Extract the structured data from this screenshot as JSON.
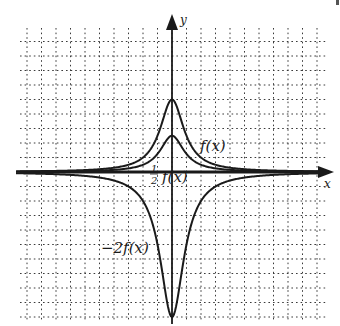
{
  "chart_data": {
    "type": "line",
    "title": "",
    "xlabel": "x",
    "ylabel": "y",
    "grid": true,
    "grid_style": "dotted",
    "xlim": [
      -10.5,
      10.5
    ],
    "ylim": [
      -10.3,
      10.3
    ],
    "axis_ticks_labeled": false,
    "series": [
      {
        "name": "f(x)",
        "label": "f(x)",
        "x": [
          -10,
          -8,
          -6,
          -4,
          -3,
          -2,
          -1.5,
          -1,
          -0.5,
          0,
          0.5,
          1,
          1.5,
          2,
          3,
          4,
          6,
          8,
          10
        ],
        "values": [
          0.05,
          0.08,
          0.14,
          0.29,
          0.5,
          1.0,
          1.54,
          2.5,
          4.0,
          5.0,
          4.0,
          2.5,
          1.54,
          1.0,
          0.5,
          0.29,
          0.14,
          0.08,
          0.05
        ]
      },
      {
        "name": "1/2 f(x)",
        "label": "1/2 f(x)",
        "x": [
          -10,
          -8,
          -6,
          -4,
          -3,
          -2,
          -1.5,
          -1,
          -0.5,
          0,
          0.5,
          1,
          1.5,
          2,
          3,
          4,
          6,
          8,
          10
        ],
        "values": [
          0.02,
          0.04,
          0.07,
          0.15,
          0.25,
          0.5,
          0.77,
          1.25,
          2.0,
          2.5,
          2.0,
          1.25,
          0.77,
          0.5,
          0.25,
          0.15,
          0.07,
          0.04,
          0.02
        ]
      },
      {
        "name": "-2f(x)",
        "label": "-2f(x)",
        "x": [
          -10,
          -8,
          -6,
          -4,
          -3,
          -2,
          -1.5,
          -1,
          -0.5,
          0,
          0.5,
          1,
          1.5,
          2,
          3,
          4,
          6,
          8,
          10
        ],
        "values": [
          -0.1,
          -0.15,
          -0.27,
          -0.59,
          -1.0,
          -2.0,
          -3.08,
          -5.0,
          -8.0,
          -10.0,
          -8.0,
          -5.0,
          -3.08,
          -2.0,
          -1.0,
          -0.59,
          -0.27,
          -0.15,
          -0.1
        ]
      }
    ],
    "annotations": [
      {
        "text": "f(x)",
        "near": "tall positive peak, right shoulder"
      },
      {
        "text": "1/2 f(x)",
        "near": "short positive peak, just above x-axis"
      },
      {
        "text": "-2f(x)",
        "near": "negative trough, left side"
      }
    ]
  },
  "labels": {
    "x_axis": "x",
    "y_axis": "y",
    "f": "f(x)",
    "half_num": "1",
    "half_den": "2",
    "half_f": "f(x)",
    "neg2f": "−2f(x)"
  },
  "colors": {
    "curve": "#1a1a1a",
    "axis": "#1a1a1a",
    "grid": "#3a3a3a",
    "background": "#ffffff"
  }
}
